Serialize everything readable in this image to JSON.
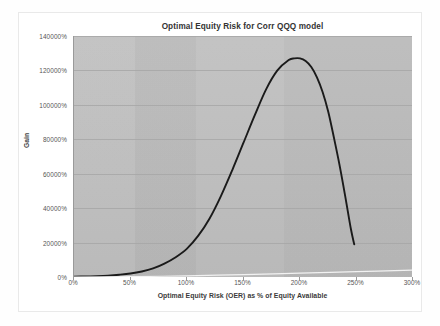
{
  "figure": {
    "background_color": "#fefefe",
    "plot_background_color": "#bebebe",
    "gridline_color": "#a7a7a7"
  },
  "chart_data": {
    "type": "line",
    "title": "Optimal Equity Risk for Corr QQQ model",
    "xlabel": "Optimal Equity Risk (OER) as % of Equity Available",
    "ylabel": "Gain",
    "xlim": [
      0,
      300
    ],
    "ylim": [
      0,
      140000
    ],
    "grid": true,
    "legend": "none",
    "x_tick_labels": [
      "0%",
      "50%",
      "100%",
      "150%",
      "200%",
      "250%",
      "300%"
    ],
    "x_tick_values": [
      0,
      50,
      100,
      150,
      200,
      250,
      300
    ],
    "y_tick_labels": [
      "0%",
      "20000%",
      "40000%",
      "60000%",
      "80000%",
      "100000%",
      "120000%",
      "140000%"
    ],
    "y_tick_values": [
      0,
      20000,
      40000,
      60000,
      80000,
      100000,
      120000,
      140000
    ],
    "series": [
      {
        "name": "Gain curve",
        "color": "#1a1a1a",
        "width": 1.9,
        "x": [
          0,
          10,
          20,
          30,
          40,
          50,
          60,
          70,
          80,
          90,
          100,
          110,
          120,
          130,
          140,
          150,
          160,
          170,
          180,
          190,
          195,
          200,
          205,
          210,
          215,
          220,
          225,
          230,
          235,
          240,
          245,
          248
        ],
        "y": [
          200,
          300,
          500,
          800,
          1300,
          2000,
          3200,
          5000,
          7800,
          11500,
          16500,
          24000,
          34000,
          47000,
          62000,
          78000,
          94000,
          109000,
          120000,
          126000,
          127000,
          127000,
          125500,
          122000,
          116000,
          107500,
          96000,
          81000,
          65000,
          47000,
          28000,
          19000
        ]
      },
      {
        "name": "Secondary faint line",
        "color": "#f2f2f2",
        "width": 1.2,
        "x": [
          0,
          50,
          100,
          150,
          200,
          250,
          300
        ],
        "y": [
          0,
          200,
          700,
          1400,
          2200,
          3100,
          4000
        ]
      }
    ],
    "peak": {
      "x": 200,
      "y": 127000
    },
    "endpoint": {
      "x": 248,
      "y": 19000
    }
  }
}
